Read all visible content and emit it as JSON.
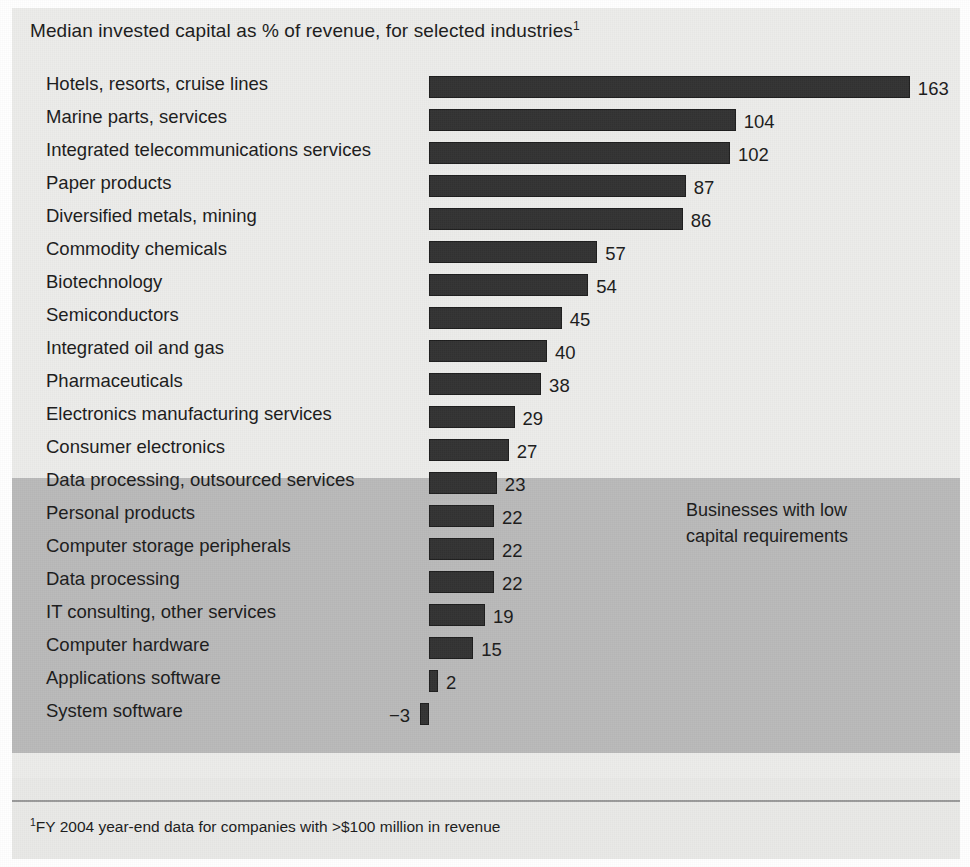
{
  "exhibit": {
    "title_text": "Median invested capital as % of revenue, for selected industries",
    "title_superscript": "1",
    "footnote_marker": "1",
    "footnote_text": "FY 2004 year-end data for companies with >$100 million in revenue",
    "callout_text": "Businesses with low\ncapital requirements",
    "colors": {
      "bar_fill": "#333333",
      "panel_background": "#ececea",
      "highlight_band": "#b9b9b9",
      "text": "#1b1b1b"
    }
  },
  "chart_data": {
    "type": "bar",
    "orientation": "horizontal",
    "title": "Median invested capital as % of revenue, for selected industries",
    "xlabel": "",
    "ylabel": "",
    "unit": "% of revenue",
    "grid": false,
    "legend": "none",
    "xlim": [
      -3,
      163
    ],
    "categories": [
      "Hotels, resorts, cruise lines",
      "Marine parts, services",
      "Integrated telecommunications services",
      "Paper products",
      "Diversified metals, mining",
      "Commodity chemicals",
      "Biotechnology",
      "Semiconductors",
      "Integrated oil and gas",
      "Pharmaceuticals",
      "Electronics manufacturing services",
      "Consumer electronics",
      "Data processing, outsourced services",
      "Personal products",
      "Computer storage peripherals",
      "Data processing",
      "IT consulting, other services",
      "Computer hardware",
      "Applications software",
      "System software"
    ],
    "values": [
      163,
      104,
      102,
      87,
      86,
      57,
      54,
      45,
      40,
      38,
      29,
      27,
      23,
      22,
      22,
      22,
      19,
      15,
      2,
      -3
    ],
    "value_labels": [
      "163",
      "104",
      "102",
      "87",
      "86",
      "57",
      "54",
      "45",
      "40",
      "38",
      "29",
      "27",
      "23",
      "22",
      "22",
      "22",
      "19",
      "15",
      "2",
      "−3"
    ],
    "highlight_group": {
      "label": "Businesses with low\ncapital requirements",
      "from_category": "Data processing, outsourced services",
      "to_category": "System software"
    },
    "annotations": [
      "Businesses with low capital requirements"
    ]
  }
}
